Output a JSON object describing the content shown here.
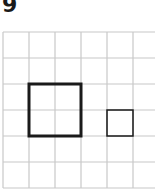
{
  "problem": {
    "number": "9"
  },
  "grid": {
    "columns": 6,
    "rows": 6,
    "origin_x": 3,
    "origin_y": 32,
    "cell_size": 26,
    "line_color": "#c8c8c8"
  },
  "shapes": [
    {
      "name": "large-square",
      "col": 1,
      "row": 2,
      "width_cells": 2,
      "height_cells": 2,
      "stroke_width": 3,
      "color": "#1a1a1a"
    },
    {
      "name": "small-square",
      "col": 4,
      "row": 3,
      "width_cells": 1,
      "height_cells": 1,
      "stroke_width": 1.5,
      "color": "#1a1a1a"
    }
  ]
}
